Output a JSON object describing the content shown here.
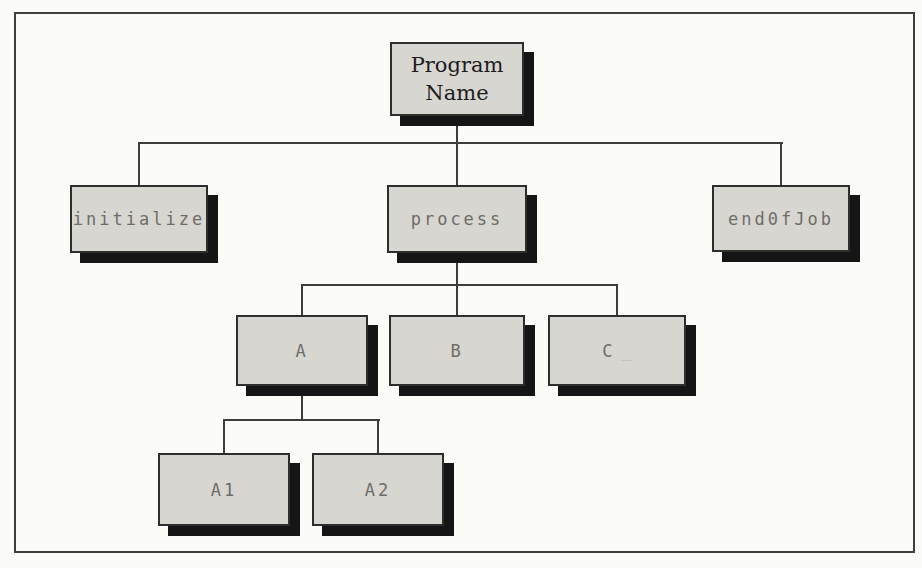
{
  "figure": {
    "kind": "program-structure-chart",
    "background_color": "#fbfbf8",
    "frame_color": "#3f3f3f",
    "box_fill_color": "#d7d6d1",
    "box_border_color": "#2e2e2e",
    "box_shadow_color": "#151515",
    "connector_color": "#3d3d3d",
    "module_text_color": "#6d6d68",
    "root_text_color": "#1d1d1d"
  },
  "nodes": [
    {
      "id": "program-name",
      "label": "Program\nName"
    },
    {
      "id": "initialize",
      "label": "initialize"
    },
    {
      "id": "process",
      "label": "process"
    },
    {
      "id": "endofjob",
      "label": "end0fJob"
    },
    {
      "id": "a",
      "label": "A"
    },
    {
      "id": "b",
      "label": "B"
    },
    {
      "id": "c",
      "label": "C",
      "suffix": "_"
    },
    {
      "id": "a1",
      "label": "A1"
    },
    {
      "id": "a2",
      "label": "A2"
    }
  ],
  "edges": [
    {
      "from": "Program Name",
      "to": "initialize"
    },
    {
      "from": "Program Name",
      "to": "process"
    },
    {
      "from": "Program Name",
      "to": "end0fJob"
    },
    {
      "from": "process",
      "to": "A"
    },
    {
      "from": "process",
      "to": "B"
    },
    {
      "from": "process",
      "to": "C"
    },
    {
      "from": "A",
      "to": "A1"
    },
    {
      "from": "A",
      "to": "A2"
    }
  ]
}
